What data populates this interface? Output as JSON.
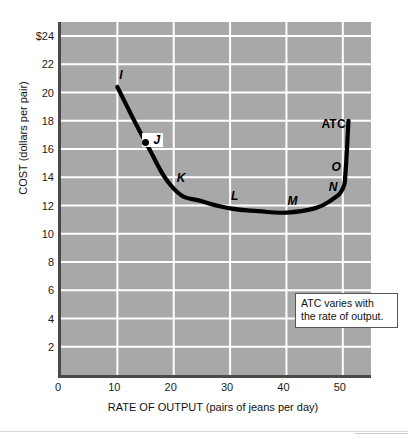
{
  "chart_data": {
    "type": "line",
    "title": "",
    "xlabel": "RATE OF OUTPUT (pairs of jeans per day)",
    "ylabel": "COST (dollars per pair)",
    "xlim": [
      0,
      55
    ],
    "ylim": [
      0,
      25
    ],
    "xticks": [
      0,
      10,
      20,
      30,
      40,
      50
    ],
    "xtick_labels": [
      "0",
      "10",
      "20",
      "30",
      "40",
      "50"
    ],
    "yticks": [
      2,
      4,
      6,
      8,
      10,
      12,
      14,
      16,
      18,
      20,
      22,
      24
    ],
    "ytick_labels": [
      "2",
      "4",
      "6",
      "8",
      "10",
      "12",
      "14",
      "16",
      "18",
      "20",
      "22",
      "$24"
    ],
    "grid": true,
    "legend": "none",
    "series": [
      {
        "name": "ATC",
        "label": "ATC",
        "color": "#000000",
        "x": [
          10,
          15,
          20,
          25,
          30,
          35,
          40,
          45,
          48,
          50,
          50.5,
          51
        ],
        "y": [
          20.4,
          16.5,
          13.2,
          12.3,
          11.8,
          11.6,
          11.5,
          11.8,
          12.4,
          13.2,
          14.5,
          18.0
        ]
      }
    ],
    "points": [
      {
        "label": "I",
        "x": 10,
        "y": 20.4,
        "boxed": false
      },
      {
        "label": "J",
        "x": 15,
        "y": 16.5,
        "boxed": true
      },
      {
        "label": "K",
        "x": 20,
        "y": 13.2,
        "boxed": false
      },
      {
        "label": "L",
        "x": 30,
        "y": 11.8,
        "boxed": false
      },
      {
        "label": "M",
        "x": 40,
        "y": 11.5,
        "boxed": false
      },
      {
        "label": "N",
        "x": 50,
        "y": 13.2,
        "boxed": false
      },
      {
        "label": "O",
        "x": 50.3,
        "y": 14.5,
        "boxed": false
      }
    ],
    "annotations": [
      {
        "line1": "ATC varies with",
        "line2": "the rate of output."
      }
    ],
    "curve_label": "ATC",
    "colors": {
      "plot_background": "#a8a8a8",
      "gridline": "#ffffff",
      "axis": "#4a4a4a",
      "curve": "#000000",
      "page_background": "#ffffff"
    }
  }
}
